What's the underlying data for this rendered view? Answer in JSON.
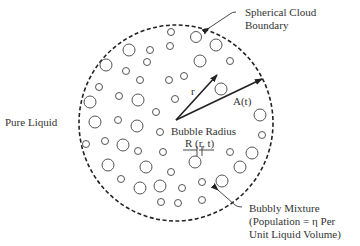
{
  "diagram": {
    "labels": {
      "boundary_line1": "Spherical Cloud",
      "boundary_line2": "Boundary",
      "pure_liquid": "Pure Liquid",
      "r": "r",
      "A": "A(t)",
      "bubble_radius": "Bubble Radius",
      "R": "R (r, t)",
      "mixture_line1": "Bubbly Mixture",
      "mixture_line2": "(Population = η Per",
      "mixture_line3": "Unit Liquid Volume)"
    },
    "colors": {
      "stroke": "#333333",
      "background": "#ffffff"
    }
  }
}
